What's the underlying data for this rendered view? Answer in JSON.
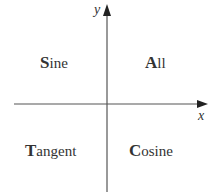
{
  "diagram": {
    "title": "",
    "axes": {
      "x_label": "x",
      "y_label": "y"
    },
    "quadrants": [
      {
        "id": "II",
        "cap": "S",
        "rest": "ine",
        "full": "Sine"
      },
      {
        "id": "I",
        "cap": "A",
        "rest": "ll",
        "full": "All"
      },
      {
        "id": "III",
        "cap": "T",
        "rest": "angent",
        "full": "Tangent"
      },
      {
        "id": "IV",
        "cap": "C",
        "rest": "osine",
        "full": "Cosine"
      }
    ],
    "colors": {
      "line": "#555555",
      "text": "#333333",
      "background": "#ffffff"
    }
  }
}
